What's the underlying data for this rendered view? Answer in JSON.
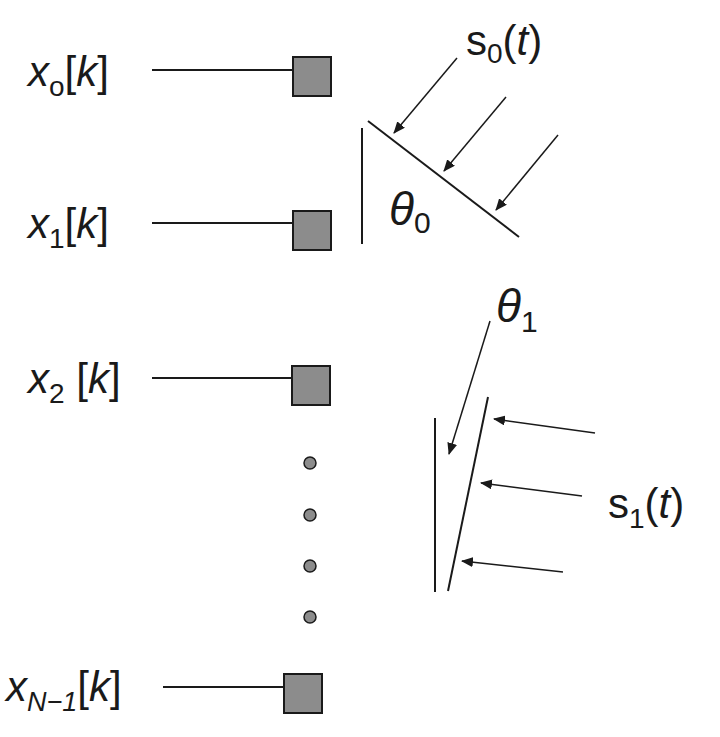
{
  "diagram": {
    "type": "sensor-array-signal-arrival",
    "sensors": [
      {
        "label_base": "x",
        "label_sub": "o",
        "label_arg": "[k]"
      },
      {
        "label_base": "x",
        "label_sub": "1",
        "label_arg": "[k]"
      },
      {
        "label_base": "x",
        "label_sub": "2",
        "label_arg": " [k]"
      },
      {
        "label_base": "x",
        "label_sub": "N−1",
        "label_arg": "[k]"
      }
    ],
    "ellipsis_dots": 4,
    "sources": [
      {
        "label_base": "s",
        "label_sub": "0",
        "label_arg": "(t)",
        "angle_label": "θ",
        "angle_sub": "0"
      },
      {
        "label_base": "s",
        "label_sub": "1",
        "label_arg": "(t)",
        "angle_label": "θ",
        "angle_sub": "1"
      }
    ],
    "colors": {
      "sensor_fill": "#8c8c8c",
      "stroke": "#1a1a1a",
      "background": "#ffffff"
    }
  }
}
